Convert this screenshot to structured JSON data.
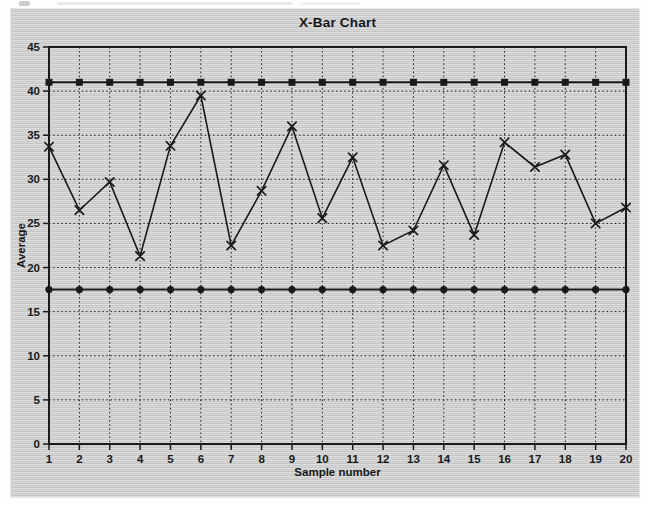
{
  "chart": {
    "title": "X-Bar Chart",
    "x_axis_label": "Sample number",
    "y_axis_label": "Average"
  },
  "chart_data": {
    "type": "line",
    "title": "X-Bar Chart",
    "xlabel": "Sample number",
    "ylabel": "Average",
    "x": [
      1,
      2,
      3,
      4,
      5,
      6,
      7,
      8,
      9,
      10,
      11,
      12,
      13,
      14,
      15,
      16,
      17,
      18,
      19,
      20
    ],
    "xticks": [
      1,
      2,
      3,
      4,
      5,
      6,
      7,
      8,
      9,
      10,
      11,
      12,
      13,
      14,
      15,
      16,
      17,
      18,
      19,
      20
    ],
    "yticks": [
      0,
      5,
      10,
      15,
      20,
      25,
      30,
      35,
      40,
      45
    ],
    "ylim": [
      0,
      45
    ],
    "grid": "dotted-both-axes",
    "legend": "none",
    "upper_control_limit": 41,
    "lower_control_limit": 17.5,
    "series": [
      {
        "name": "average",
        "marker": "x",
        "values": [
          33.7,
          26.5,
          29.7,
          21.3,
          33.8,
          39.5,
          22.5,
          28.7,
          36.0,
          25.6,
          32.5,
          22.5,
          24.2,
          31.6,
          23.7,
          34.2,
          31.4,
          32.8,
          25.0,
          26.8
        ]
      },
      {
        "name": "upper control limit",
        "marker": "square",
        "values": [
          41,
          41,
          41,
          41,
          41,
          41,
          41,
          41,
          41,
          41,
          41,
          41,
          41,
          41,
          41,
          41,
          41,
          41,
          41,
          41
        ]
      },
      {
        "name": "lower control limit",
        "marker": "circle",
        "values": [
          17.5,
          17.5,
          17.5,
          17.5,
          17.5,
          17.5,
          17.5,
          17.5,
          17.5,
          17.5,
          17.5,
          17.5,
          17.5,
          17.5,
          17.5,
          17.5,
          17.5,
          17.5,
          17.5,
          17.5
        ]
      }
    ]
  },
  "colors": {
    "ink": "#1a1a1a",
    "panel_light": "#d9d9d9",
    "panel_dark": "#c7c7c7",
    "page_bg": "#fdfdfd"
  }
}
